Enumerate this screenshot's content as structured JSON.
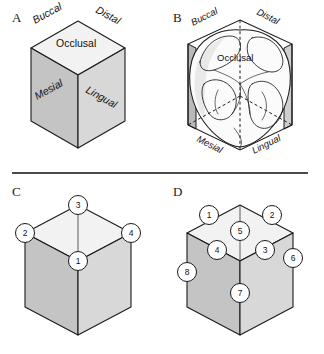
{
  "figure": {
    "divider_rule": true,
    "panels": [
      {
        "id": "A",
        "letter": "A",
        "caption": "Schematic cube representing the crown of a posterior tooth with its named surfaces",
        "surface_labels": [
          {
            "name": "Buccal",
            "text": "Buccal",
            "style": "italic",
            "position": "top-left-edge"
          },
          {
            "name": "Distal",
            "text": "Distal",
            "style": "italic",
            "position": "top-right-edge"
          },
          {
            "name": "Occlusal",
            "text": "Occlusal",
            "style": "upright",
            "position": "top-face"
          },
          {
            "name": "Mesial",
            "text": "Mesial",
            "style": "italic",
            "position": "left-face"
          },
          {
            "name": "Lingual",
            "text": "Lingual",
            "style": "italic",
            "position": "right-face"
          }
        ]
      },
      {
        "id": "B",
        "letter": "B",
        "caption": "Molar crown drawn inside the same cube, relating real tooth anatomy to the cube surfaces",
        "surface_labels": [
          {
            "name": "Buccal",
            "text": "Buccal",
            "style": "italic",
            "position": "top-left-edge"
          },
          {
            "name": "Distal",
            "text": "Distal",
            "style": "italic",
            "position": "top-right-edge"
          },
          {
            "name": "Occlusal",
            "text": "Occlusal",
            "style": "upright",
            "position": "top-face"
          },
          {
            "name": "Mesial",
            "text": "Mesial",
            "style": "italic",
            "position": "bottom-left-edge"
          },
          {
            "name": "Lingual",
            "text": "Lingual",
            "style": "italic",
            "position": "bottom-right-edge"
          }
        ]
      },
      {
        "id": "C",
        "letter": "C",
        "caption": "Cube with four point angles numbered 1 to 4",
        "callouts": [
          {
            "number": "1",
            "location": "front-top-vertex"
          },
          {
            "number": "2",
            "location": "left-top-vertex"
          },
          {
            "number": "3",
            "location": "back-top-vertex"
          },
          {
            "number": "4",
            "location": "right-top-vertex"
          }
        ]
      },
      {
        "id": "D",
        "letter": "D",
        "caption": "Cube with eight line angles numbered 1 to 8",
        "callouts": [
          {
            "number": "1",
            "location": "top-back-left-edge"
          },
          {
            "number": "2",
            "location": "top-back-right-edge"
          },
          {
            "number": "3",
            "location": "top-front-right-edge"
          },
          {
            "number": "4",
            "location": "top-front-left-edge"
          },
          {
            "number": "5",
            "location": "top-center-vertical-edge"
          },
          {
            "number": "6",
            "location": "right-vertical-edge"
          },
          {
            "number": "7",
            "location": "front-vertical-edge"
          },
          {
            "number": "8",
            "location": "left-vertical-edge"
          }
        ]
      }
    ]
  },
  "colors": {
    "top_face": "#f2f2f2",
    "left_face": "#c4c4c4",
    "right_face": "#d8d8d8",
    "outline": "#1a1a1a",
    "background": "#ffffff"
  }
}
